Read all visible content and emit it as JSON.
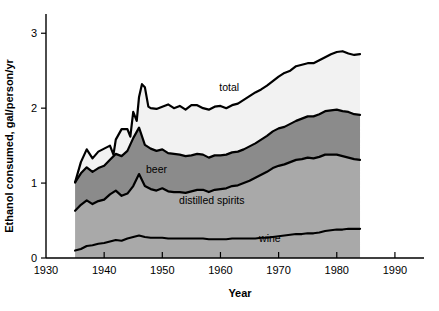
{
  "chart_data": {
    "type": "area",
    "stacked": true,
    "title": "",
    "xlabel": "Year",
    "ylabel": "Ethanol consumed, gal/person/yr",
    "xlim": [
      1930,
      1995
    ],
    "ylim": [
      0,
      3.15
    ],
    "xticks": [
      1930,
      1940,
      1950,
      1960,
      1970,
      1980,
      1990
    ],
    "yticks": [
      0,
      1,
      2,
      3
    ],
    "grid": false,
    "legend": "inline-annotations",
    "x": [
      1935,
      1936,
      1937,
      1938,
      1939,
      1940,
      1941,
      1942,
      1943,
      1944,
      1945,
      1946,
      1947,
      1948,
      1949,
      1950,
      1951,
      1952,
      1953,
      1954,
      1955,
      1956,
      1957,
      1958,
      1959,
      1960,
      1961,
      1962,
      1963,
      1964,
      1965,
      1966,
      1967,
      1968,
      1969,
      1970,
      1971,
      1972,
      1973,
      1974,
      1975,
      1976,
      1977,
      1978,
      1979,
      1980,
      1981,
      1982,
      1983,
      1984
    ],
    "series": [
      {
        "name": "wine",
        "label": "wine",
        "color": "#a9a9a9",
        "values": [
          0.1,
          0.12,
          0.16,
          0.17,
          0.19,
          0.2,
          0.22,
          0.24,
          0.23,
          0.26,
          0.28,
          0.3,
          0.28,
          0.27,
          0.27,
          0.27,
          0.26,
          0.26,
          0.26,
          0.26,
          0.26,
          0.26,
          0.26,
          0.25,
          0.25,
          0.25,
          0.25,
          0.26,
          0.26,
          0.26,
          0.26,
          0.26,
          0.27,
          0.27,
          0.28,
          0.29,
          0.3,
          0.31,
          0.32,
          0.32,
          0.33,
          0.33,
          0.34,
          0.36,
          0.37,
          0.38,
          0.38,
          0.39,
          0.39,
          0.39
        ]
      },
      {
        "name": "distilled-spirits",
        "label": "distilled spirits",
        "color": "#a9a9a9",
        "values": [
          0.53,
          0.59,
          0.61,
          0.55,
          0.57,
          0.58,
          0.63,
          0.66,
          0.6,
          0.6,
          0.68,
          0.82,
          0.68,
          0.65,
          0.63,
          0.66,
          0.63,
          0.62,
          0.62,
          0.61,
          0.63,
          0.65,
          0.65,
          0.63,
          0.66,
          0.67,
          0.68,
          0.7,
          0.71,
          0.74,
          0.77,
          0.81,
          0.84,
          0.88,
          0.92,
          0.94,
          0.95,
          0.97,
          0.99,
          1.0,
          1.01,
          1.0,
          1.01,
          1.02,
          1.01,
          1.0,
          0.98,
          0.95,
          0.93,
          0.92
        ]
      },
      {
        "name": "beer",
        "label": "beer",
        "color": "#8b8b8b",
        "values": [
          0.38,
          0.42,
          0.44,
          0.43,
          0.44,
          0.45,
          0.46,
          0.49,
          0.53,
          0.57,
          0.64,
          0.62,
          0.55,
          0.54,
          0.53,
          0.52,
          0.51,
          0.51,
          0.5,
          0.49,
          0.48,
          0.48,
          0.47,
          0.46,
          0.46,
          0.45,
          0.45,
          0.45,
          0.45,
          0.45,
          0.46,
          0.46,
          0.47,
          0.48,
          0.49,
          0.5,
          0.5,
          0.51,
          0.52,
          0.54,
          0.55,
          0.56,
          0.57,
          0.58,
          0.59,
          0.6,
          0.6,
          0.61,
          0.6,
          0.6
        ]
      },
      {
        "name": "total-headroom",
        "label": "total",
        "color": "#f2f2f2",
        "values": [
          0.02,
          0.02,
          0.02,
          0.02,
          0.02,
          0.02,
          0.02,
          0.02,
          0.02,
          0.02,
          0.02,
          0.02,
          0.02,
          0.02,
          0.02,
          0.02,
          0.02,
          0.02,
          0.02,
          0.02,
          0.02,
          0.02,
          0.02,
          0.02,
          0.02,
          0.02,
          0.02,
          0.02,
          0.02,
          0.02,
          0.02,
          0.02,
          0.02,
          0.02,
          0.02,
          0.02,
          0.02,
          0.02,
          0.02,
          0.02,
          0.02,
          0.02,
          0.02,
          0.02,
          0.02,
          0.02,
          0.02,
          0.02,
          0.02,
          0.02
        ]
      }
    ],
    "total": {
      "name": "total",
      "label": "total",
      "values": [
        1.03,
        1.15,
        1.23,
        1.17,
        1.22,
        1.25,
        1.33,
        1.41,
        1.38,
        1.45,
        1.62,
        1.76,
        1.53,
        1.48,
        1.45,
        1.47,
        1.42,
        1.41,
        1.4,
        1.38,
        1.39,
        1.41,
        1.4,
        1.36,
        1.39,
        1.39,
        1.4,
        1.43,
        1.44,
        1.47,
        1.51,
        1.55,
        1.6,
        1.65,
        1.71,
        1.75,
        1.77,
        1.81,
        1.85,
        1.88,
        1.91,
        1.91,
        1.94,
        1.98,
        1.99,
        2.0,
        1.98,
        1.97,
        1.94,
        1.93
      ],
      "outline": [
        [
          1935,
          1.01
        ],
        [
          1936,
          1.28
        ],
        [
          1937,
          1.45
        ],
        [
          1938,
          1.33
        ],
        [
          1939,
          1.42
        ],
        [
          1940,
          1.46
        ],
        [
          1941,
          1.5
        ],
        [
          1941.6,
          1.38
        ],
        [
          1942,
          1.58
        ],
        [
          1943,
          1.72
        ],
        [
          1944,
          1.72
        ],
        [
          1944.5,
          1.62
        ],
        [
          1945,
          1.95
        ],
        [
          1945.6,
          1.83
        ],
        [
          1946,
          2.15
        ],
        [
          1946.5,
          2.32
        ],
        [
          1947,
          2.28
        ],
        [
          1947.6,
          2.02
        ],
        [
          1948,
          2.0
        ],
        [
          1949,
          1.99
        ],
        [
          1950,
          2.02
        ],
        [
          1951,
          2.05
        ],
        [
          1952,
          2.0
        ],
        [
          1953,
          2.03
        ],
        [
          1954,
          1.98
        ],
        [
          1955,
          2.04
        ],
        [
          1956,
          2.04
        ],
        [
          1957,
          2.0
        ],
        [
          1958,
          1.98
        ],
        [
          1959,
          2.02
        ],
        [
          1960,
          2.03
        ],
        [
          1961,
          2.0
        ],
        [
          1962,
          2.04
        ],
        [
          1963,
          2.06
        ],
        [
          1964,
          2.11
        ],
        [
          1965,
          2.16
        ],
        [
          1966,
          2.21
        ],
        [
          1967,
          2.25
        ],
        [
          1968,
          2.3
        ],
        [
          1969,
          2.36
        ],
        [
          1970,
          2.42
        ],
        [
          1971,
          2.47
        ],
        [
          1972,
          2.5
        ],
        [
          1973,
          2.56
        ],
        [
          1974,
          2.58
        ],
        [
          1975,
          2.6
        ],
        [
          1976,
          2.6
        ],
        [
          1977,
          2.64
        ],
        [
          1978,
          2.68
        ],
        [
          1979,
          2.72
        ],
        [
          1980,
          2.75
        ],
        [
          1981,
          2.76
        ],
        [
          1982,
          2.73
        ],
        [
          1983,
          2.71
        ],
        [
          1984,
          2.72
        ]
      ]
    },
    "annotations": [
      {
        "name": "total",
        "text": "total",
        "x": 1961.5,
        "y": 2.23
      },
      {
        "name": "beer",
        "text": "beer",
        "x": 1949.0,
        "y": 1.13
      },
      {
        "name": "distilled-spirits",
        "text": "distilled spirits",
        "x": 1958.5,
        "y": 0.72
      },
      {
        "name": "wine",
        "text": "wine",
        "x": 1968.5,
        "y": 0.22
      }
    ]
  }
}
